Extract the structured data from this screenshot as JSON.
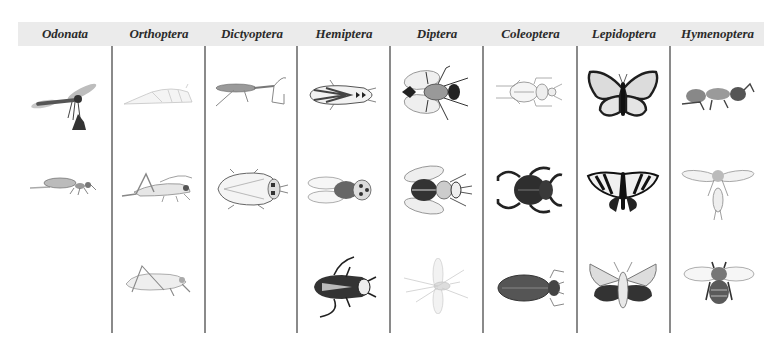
{
  "orders": [
    {
      "name": "Odonata",
      "specimens": [
        "damselfly-icon",
        "dragonfly-nymph-icon"
      ]
    },
    {
      "name": "Orthoptera",
      "specimens": [
        "grasshopper-pale-icon",
        "grasshopper-icon",
        "cricket-icon"
      ]
    },
    {
      "name": "Dictyoptera",
      "specimens": [
        "mantis-icon",
        "cockroach-icon"
      ]
    },
    {
      "name": "Hemiptera",
      "specimens": [
        "leafhopper-icon",
        "cicada-icon",
        "water-bug-icon"
      ]
    },
    {
      "name": "Diptera",
      "specimens": [
        "housefly-icon",
        "horsefly-icon",
        "crane-fly-icon"
      ]
    },
    {
      "name": "Coleoptera",
      "specimens": [
        "ground-beetle-icon",
        "scarab-beetle-icon",
        "longhorn-beetle-icon"
      ]
    },
    {
      "name": "Lepidoptera",
      "specimens": [
        "monarch-butterfly-icon",
        "swallowtail-butterfly-icon",
        "sphinx-moth-icon"
      ]
    },
    {
      "name": "Hymenoptera",
      "specimens": [
        "ant-icon",
        "wasp-icon",
        "bee-icon"
      ]
    }
  ],
  "colors": {
    "header_bg": "#ebebeb",
    "divider": "#8a8a8a",
    "label_text": "#2a2a2a"
  }
}
